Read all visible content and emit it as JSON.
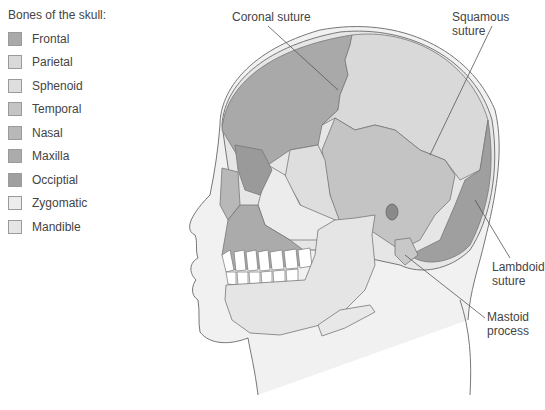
{
  "legend": {
    "title": "Bones of the skull:",
    "items": [
      {
        "label": "Frontal",
        "color": "#a9a9a9"
      },
      {
        "label": "Parietal",
        "color": "#d9d9d9"
      },
      {
        "label": "Sphenoid",
        "color": "#dedede"
      },
      {
        "label": "Temporal",
        "color": "#c4c4c4"
      },
      {
        "label": "Nasal",
        "color": "#b8b8b8"
      },
      {
        "label": "Maxilla",
        "color": "#ababab"
      },
      {
        "label": "Occiptial",
        "color": "#9f9f9f"
      },
      {
        "label": "Zygomatic",
        "color": "#ececec"
      },
      {
        "label": "Mandible",
        "color": "#e5e5e5"
      }
    ]
  },
  "annotations": {
    "coronal": "Coronal suture",
    "squamous": "Squamous suture",
    "lambdoid_1": "Lambdoid",
    "lambdoid_2": "suture",
    "mastoid_1": "Mastoid",
    "mastoid_2": "process"
  }
}
